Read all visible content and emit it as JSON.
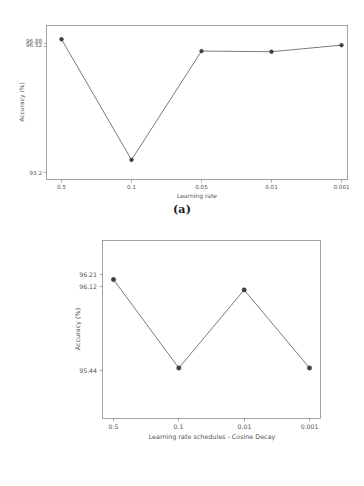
{
  "figure": {
    "background": "#ffffff",
    "line_color": "#6b6b6b",
    "marker_color": "#3f3f3f",
    "axis_color": "#8c8c8c"
  },
  "panels": [
    {
      "caption": "(a)",
      "chart_data": {
        "type": "line",
        "title": "",
        "xlabel": "Learning rate",
        "ylabel": "Accuracy (%)",
        "categories": [
          "0.5",
          "0.1",
          "0.05",
          "0.01",
          "0.001"
        ],
        "values": [
          96.88,
          93.2,
          96.52,
          96.5,
          96.7
        ],
        "ytick_labels": [
          "96.88",
          "96.52",
          "93.2"
        ],
        "ytick_values": [
          96.88,
          96.52,
          93.2
        ],
        "ylim": [
          92.6,
          97.3
        ],
        "grid": false,
        "legend": "none",
        "notes": "Top two y-tick labels overlap in the rendering"
      }
    },
    {
      "caption": "(b)",
      "chart_data": {
        "type": "line",
        "title": "",
        "xlabel": "Learning rate schedules - Cosine Decay",
        "ylabel": "Accuracy (%)",
        "categories": [
          "0.5",
          "0.1",
          "0.01",
          "0.001"
        ],
        "values": [
          96.21,
          95.44,
          96.12,
          95.44
        ],
        "ytick_labels": [
          "96.21",
          "96.12",
          "95.44"
        ],
        "ytick_values": [
          96.21,
          96.12,
          95.44
        ],
        "ylim": [
          95.0,
          96.55
        ],
        "grid": false,
        "legend": "none"
      }
    }
  ]
}
